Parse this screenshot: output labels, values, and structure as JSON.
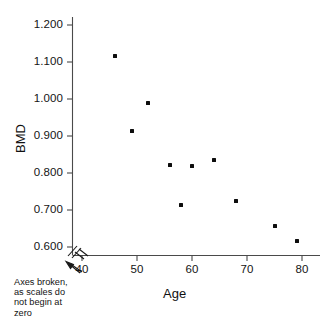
{
  "chart_data": {
    "type": "scatter",
    "title": "",
    "xlabel": "Age",
    "ylabel": "BMD",
    "xlim": [
      38,
      82
    ],
    "ylim": [
      0.58,
      1.22
    ],
    "grid": false,
    "legend": "none",
    "axis_break_note": "Axes broken, as scales do not begin at zero",
    "x_ticks": [
      40,
      50,
      60,
      70,
      80
    ],
    "x_tick_labels": [
      "40",
      "50",
      "60",
      "70",
      "80"
    ],
    "y_ticks": [
      0.6,
      0.7,
      0.8,
      0.9,
      1.0,
      1.1,
      1.2
    ],
    "y_tick_labels": [
      "0.600",
      "0.700",
      "0.800",
      "0.900",
      "1.000",
      "1.100",
      "1.200"
    ],
    "points": [
      {
        "x": 46,
        "y": 1.115
      },
      {
        "x": 49,
        "y": 0.913
      },
      {
        "x": 52,
        "y": 0.988
      },
      {
        "x": 56,
        "y": 0.822
      },
      {
        "x": 58,
        "y": 0.713
      },
      {
        "x": 60,
        "y": 0.818
      },
      {
        "x": 64,
        "y": 0.836
      },
      {
        "x": 68,
        "y": 0.724
      },
      {
        "x": 75,
        "y": 0.657
      },
      {
        "x": 79,
        "y": 0.615
      }
    ]
  },
  "annotations": {
    "break_note_line1": "Axes broken,",
    "break_note_line2": "as scales do",
    "break_note_line3": "not begin at",
    "break_note_line4": "zero"
  }
}
